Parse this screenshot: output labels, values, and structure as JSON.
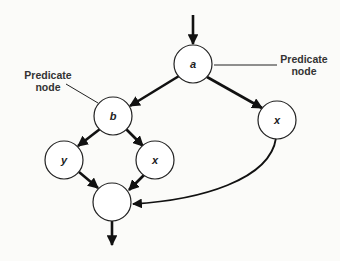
{
  "diagram": {
    "type": "control-flow-graph",
    "nodes": [
      {
        "id": "a",
        "label": "a"
      },
      {
        "id": "b",
        "label": "b"
      },
      {
        "id": "x_right",
        "label": "x"
      },
      {
        "id": "y",
        "label": "y"
      },
      {
        "id": "x_mid",
        "label": "x"
      },
      {
        "id": "join",
        "label": ""
      }
    ],
    "edges": [
      {
        "from": "entry",
        "to": "a"
      },
      {
        "from": "a",
        "to": "b"
      },
      {
        "from": "a",
        "to": "x_right"
      },
      {
        "from": "b",
        "to": "y"
      },
      {
        "from": "b",
        "to": "x_mid"
      },
      {
        "from": "y",
        "to": "join"
      },
      {
        "from": "x_mid",
        "to": "join"
      },
      {
        "from": "x_right",
        "to": "join"
      },
      {
        "from": "join",
        "to": "exit"
      }
    ],
    "annotations": [
      {
        "target": "a",
        "line1": "Predicate",
        "line2": "node"
      },
      {
        "target": "b",
        "line1": "Predicate",
        "line2": "node"
      }
    ]
  }
}
